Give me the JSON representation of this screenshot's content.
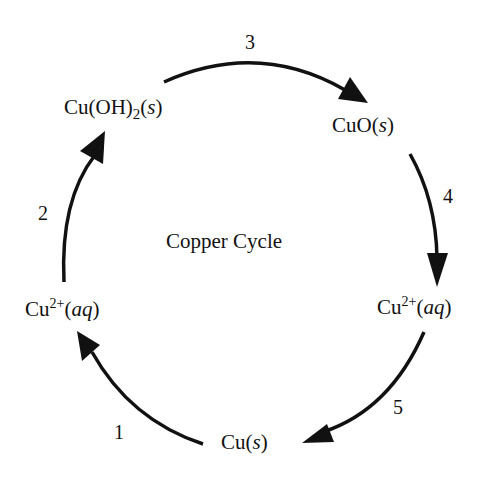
{
  "diagram": {
    "title": "Copper Cycle",
    "species": {
      "cu_oh2": {
        "base": "Cu(OH)",
        "sub": "2",
        "open": "(",
        "state": "s",
        "close": ")"
      },
      "cuo": {
        "base": "CuO",
        "open": "(",
        "state": "s",
        "close": ")"
      },
      "cu2_right": {
        "base": "Cu",
        "sup": "2+",
        "open": "(",
        "state": "aq",
        "close": ")"
      },
      "cu_s": {
        "base": "Cu",
        "open": "(",
        "state": "s",
        "close": ")"
      },
      "cu2_left": {
        "base": "Cu",
        "sup": "2+",
        "open": "(",
        "state": "aq",
        "close": ")"
      }
    },
    "steps": [
      {
        "label": "1",
        "from": "Cu(s)",
        "to": "Cu2+(aq)"
      },
      {
        "label": "2",
        "from": "Cu2+(aq)",
        "to": "Cu(OH)2(s)"
      },
      {
        "label": "3",
        "from": "Cu(OH)2(s)",
        "to": "CuO(s)"
      },
      {
        "label": "4",
        "from": "CuO(s)",
        "to": "Cu2+(aq)"
      },
      {
        "label": "5",
        "from": "Cu2+(aq)",
        "to": "Cu(s)"
      }
    ],
    "colors": {
      "stroke": "#111111",
      "background": "#ffffff"
    }
  }
}
